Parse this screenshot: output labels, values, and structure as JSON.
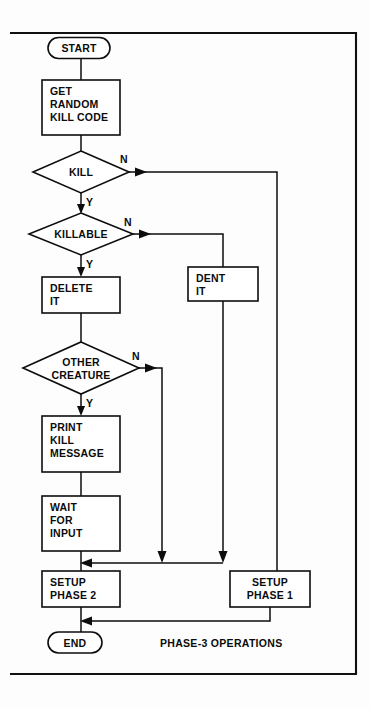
{
  "diagram": {
    "caption": "PHASE-3 OPERATIONS",
    "colors": {
      "ink": "#0d0d0d",
      "paper": "#fdfdfd",
      "shape_fill": "#ffffff"
    },
    "frame": {
      "x": 10,
      "y": 32,
      "width": 347,
      "height": 643
    },
    "nodes": [
      {
        "id": "start",
        "type": "terminator",
        "label": "START",
        "lines": [
          "START"
        ],
        "cx": 79,
        "cy": 48,
        "w": 62,
        "h": 21
      },
      {
        "id": "get_code",
        "type": "process",
        "label": "GET RANDOM KILL CODE",
        "lines": [
          "GET",
          "RANDOM",
          "KILL CODE"
        ],
        "cx": 81,
        "cy": 107,
        "w": 78,
        "h": 55
      },
      {
        "id": "kill",
        "type": "decision",
        "label": "KILL",
        "lines": [
          "KILL"
        ],
        "cx": 81,
        "cy": 172,
        "w": 96,
        "h": 42
      },
      {
        "id": "killable",
        "type": "decision",
        "label": "KILLABLE",
        "lines": [
          "KILLABLE"
        ],
        "cx": 81,
        "cy": 234,
        "w": 104,
        "h": 42
      },
      {
        "id": "delete_it",
        "type": "process",
        "label": "DELETE IT",
        "lines": [
          "DELETE",
          "IT"
        ],
        "cx": 81,
        "cy": 295,
        "w": 78,
        "h": 36
      },
      {
        "id": "other_creature",
        "type": "decision",
        "label": "OTHER CREATURE",
        "lines": [
          "OTHER",
          "CREATURE"
        ],
        "cx": 81,
        "cy": 368,
        "w": 116,
        "h": 52
      },
      {
        "id": "print_message",
        "type": "process",
        "label": "PRINT KILL MESSAGE",
        "lines": [
          "PRINT",
          "KILL",
          "MESSAGE"
        ],
        "cx": 81,
        "cy": 444,
        "w": 78,
        "h": 55
      },
      {
        "id": "wait_input",
        "type": "process",
        "label": "WAIT FOR INPUT",
        "lines": [
          "WAIT",
          "FOR",
          "INPUT"
        ],
        "cx": 81,
        "cy": 523,
        "w": 78,
        "h": 55
      },
      {
        "id": "setup_phase_2",
        "type": "process",
        "label": "SETUP PHASE 2",
        "lines": [
          "SETUP",
          "PHASE 2"
        ],
        "cx": 81,
        "cy": 589,
        "w": 78,
        "h": 36
      },
      {
        "id": "end",
        "type": "terminator",
        "label": "END",
        "lines": [
          "END"
        ],
        "cx": 75,
        "cy": 643,
        "w": 54,
        "h": 21
      },
      {
        "id": "dent_it",
        "type": "process",
        "label": "DENT IT",
        "lines": [
          "DENT",
          "IT"
        ],
        "cx": 223,
        "cy": 284,
        "w": 70,
        "h": 34
      },
      {
        "id": "setup_phase_1",
        "type": "process",
        "label": "SETUP PHASE 1",
        "lines": [
          "SETUP",
          "PHASE 1"
        ],
        "cx": 270,
        "cy": 589,
        "w": 80,
        "h": 36
      }
    ],
    "branch_labels": [
      {
        "id": "kill-n",
        "text": "N",
        "x": 120,
        "y": 163
      },
      {
        "id": "kill-y",
        "text": "Y",
        "x": 86,
        "y": 203
      },
      {
        "id": "killable-n",
        "text": "N",
        "x": 124,
        "y": 226
      },
      {
        "id": "killable-y",
        "text": "Y",
        "x": 86,
        "y": 265
      },
      {
        "id": "other-creature-n",
        "text": "N",
        "x": 132,
        "y": 360
      },
      {
        "id": "other-creature-y",
        "text": "Y",
        "x": 86,
        "y": 402
      }
    ],
    "edges": [
      {
        "id": "start-to-get-code",
        "from": "start",
        "to": "get_code",
        "label": ""
      },
      {
        "id": "get-code-to-kill",
        "from": "get_code",
        "to": "kill",
        "label": ""
      },
      {
        "id": "kill-yes-to-killable",
        "from": "kill",
        "to": "killable",
        "label": "Y"
      },
      {
        "id": "kill-no-to-setup-phase-1",
        "from": "kill",
        "to": "setup_phase_1",
        "label": "N"
      },
      {
        "id": "killable-yes-to-delete-it",
        "from": "killable",
        "to": "delete_it",
        "label": "Y"
      },
      {
        "id": "killable-no-to-dent-it",
        "from": "killable",
        "to": "dent_it",
        "label": "N"
      },
      {
        "id": "delete-it-to-other-creature",
        "from": "delete_it",
        "to": "other_creature",
        "label": ""
      },
      {
        "id": "other-creature-yes-to-print",
        "from": "other_creature",
        "to": "print_message",
        "label": "Y"
      },
      {
        "id": "other-creature-no-to-merge",
        "from": "other_creature",
        "to": "setup_phase_2",
        "label": "N"
      },
      {
        "id": "print-to-wait",
        "from": "print_message",
        "to": "wait_input",
        "label": ""
      },
      {
        "id": "wait-to-setup-phase-2",
        "from": "wait_input",
        "to": "setup_phase_2",
        "label": ""
      },
      {
        "id": "dent-it-to-merge",
        "from": "dent_it",
        "to": "setup_phase_2",
        "label": ""
      },
      {
        "id": "setup-phase-2-to-end",
        "from": "setup_phase_2",
        "to": "end",
        "label": ""
      },
      {
        "id": "setup-phase-1-to-end",
        "from": "setup_phase_1",
        "to": "end",
        "label": ""
      }
    ]
  }
}
